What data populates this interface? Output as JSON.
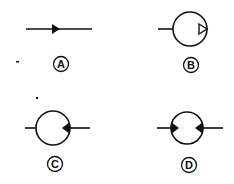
{
  "diagram": {
    "colors": {
      "ink": "#111111",
      "background": "#ffffff"
    },
    "symbols": [
      {
        "id": "A",
        "label": "A",
        "description": "line with single arrowhead pointing right (flow direction)"
      },
      {
        "id": "B",
        "label": "B",
        "description": "circle with inlet line on left and hollow triangle on inside right edge pointing outward"
      },
      {
        "id": "C",
        "label": "C",
        "description": "circle with lines on both sides and solid triangle on right edge pointing inward"
      },
      {
        "id": "D",
        "label": "D",
        "description": "circle with lines on both sides and solid triangles on both edges pointing inward"
      }
    ]
  }
}
